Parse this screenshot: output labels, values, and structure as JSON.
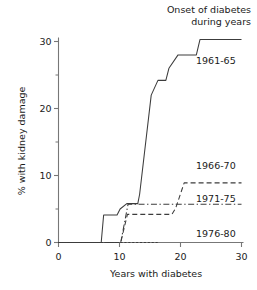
{
  "chart_data": {
    "type": "line",
    "title": "",
    "legend_title_lines": [
      "Onset of diabetes",
      "during years"
    ],
    "xlabel": "Years with diabetes",
    "ylabel": "% with kidney damage",
    "xlim": [
      0,
      30
    ],
    "ylim": [
      0,
      32
    ],
    "xticks": [
      0,
      10,
      20,
      30
    ],
    "xtick_labels": [
      "0",
      "10",
      "20",
      "30"
    ],
    "yticks": [
      0,
      10,
      20,
      30
    ],
    "ytick_labels": [
      "0",
      "10",
      "20",
      "30"
    ],
    "yminorticks": [
      5,
      15,
      25
    ],
    "grid": false,
    "legend_position": "right-of-curve-ends",
    "series": [
      {
        "name": "1961-65",
        "style": "solid",
        "points": [
          [
            0,
            0
          ],
          [
            7,
            0
          ],
          [
            7.4,
            4.1
          ],
          [
            9.6,
            4.1
          ],
          [
            10.1,
            5.0
          ],
          [
            11.2,
            5.8
          ],
          [
            13.0,
            5.8
          ],
          [
            13.3,
            7.2
          ],
          [
            15.2,
            22.0
          ],
          [
            16.3,
            24.2
          ],
          [
            17.6,
            24.2
          ],
          [
            18.1,
            26.0
          ],
          [
            19.6,
            28.0
          ],
          [
            22.6,
            28.0
          ],
          [
            23.2,
            30.3
          ],
          [
            30,
            30.3
          ]
        ]
      },
      {
        "name": "1966-70",
        "style": "dashed",
        "points": [
          [
            0,
            0
          ],
          [
            10.2,
            0
          ],
          [
            11.3,
            4.2
          ],
          [
            18.6,
            4.2
          ],
          [
            19.2,
            5.1
          ],
          [
            20.6,
            8.9
          ],
          [
            30,
            8.9
          ]
        ]
      },
      {
        "name": "1971-75",
        "style": "dashdot",
        "points": [
          [
            0,
            0
          ],
          [
            10.2,
            0
          ],
          [
            11.4,
            5.7
          ],
          [
            30,
            5.7
          ]
        ]
      },
      {
        "name": "1976-80",
        "style": "dotted",
        "points": [
          [
            0,
            0
          ],
          [
            10.2,
            0
          ],
          [
            16.3,
            0
          ]
        ]
      }
    ]
  },
  "colors": {
    "line": "#3c3c3c",
    "axis": "#777777",
    "text": "#1a1a1a"
  }
}
